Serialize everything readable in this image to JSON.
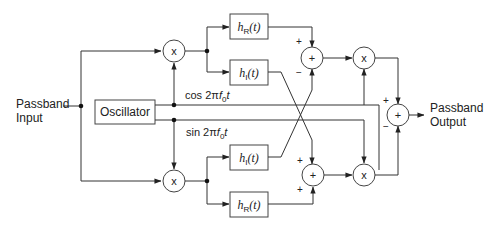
{
  "diagram": {
    "input_label_line1": "Passband",
    "input_label_line2": "Input",
    "output_label_line1": "Passband",
    "output_label_line2": "Output",
    "oscillator_label": "Oscillator",
    "cos_label_prefix": "cos 2π",
    "cos_label_f": "f",
    "cos_label_sub": "0",
    "cos_label_t": "t",
    "sin_label_prefix": "sin 2π",
    "sin_label_f": "f",
    "sin_label_sub": "0",
    "sin_label_t": "t",
    "mixer_symbol": "x",
    "sum_symbol": "+",
    "filters": {
      "top_real": {
        "h": "h",
        "sub": "R",
        "arg": "(t)"
      },
      "top_imag": {
        "h": "h",
        "sub": "I",
        "arg": "(t)"
      },
      "bottom_imag": {
        "h": "h",
        "sub": "I",
        "arg": "(t)"
      },
      "bottom_real": {
        "h": "h",
        "sub": "R",
        "arg": "(t)"
      }
    },
    "signs": {
      "top_sum_upper": "+",
      "top_sum_lower": "−",
      "bottom_sum_upper": "+",
      "bottom_sum_lower": "+",
      "final_sum_upper": "+",
      "final_sum_lower": "−"
    },
    "colors": {
      "stroke": "#333333",
      "background": "#ffffff"
    }
  }
}
